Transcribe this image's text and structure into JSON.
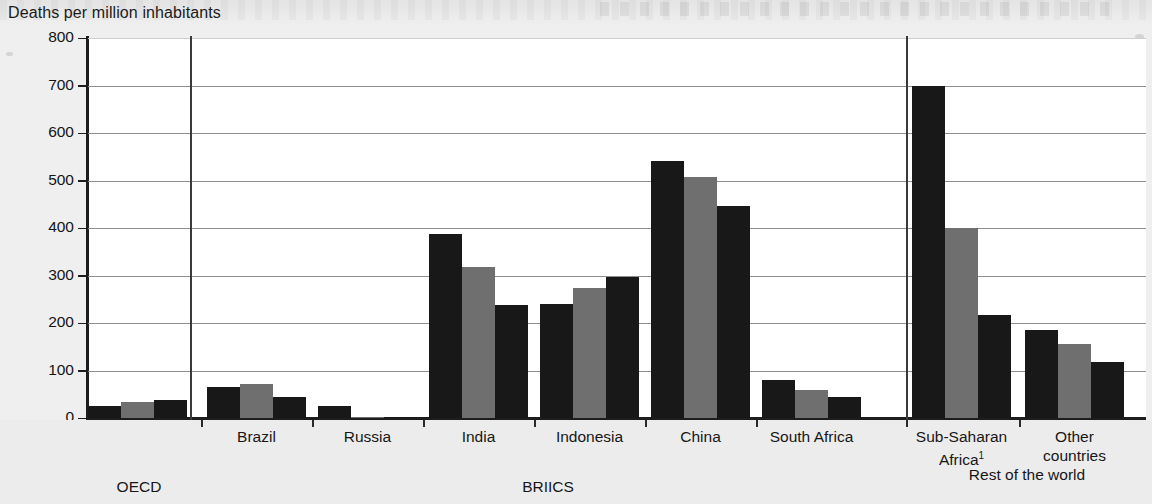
{
  "axis_title": "Deaths per million inhabitants",
  "colors": {
    "series_dark": "#181818",
    "series_gray": "#6f6f6f",
    "background": "#ececec",
    "plot_background": "#ffffff",
    "gridline": "#8e8e8e",
    "axis": "#1d1d1d"
  },
  "ytick_labels": [
    "800",
    "700",
    "600",
    "500",
    "400",
    "300",
    "200",
    "100",
    "0"
  ],
  "category_labels": [
    "OECD",
    "Brazil",
    "Russia",
    "India",
    "Indonesia",
    "China",
    "South Africa",
    "Sub-Saharan Africa",
    "Other countries"
  ],
  "supergroups": [
    {
      "label": "OECD"
    },
    {
      "label": "BRIICS"
    },
    {
      "label": "Rest of the world"
    }
  ],
  "footnote_marker": "1",
  "chart_data": {
    "type": "bar",
    "title": "Deaths per million inhabitants",
    "xlabel": "",
    "ylabel": "Deaths per million inhabitants",
    "ylim": [
      0,
      800
    ],
    "ytick_step": 100,
    "grid": true,
    "legend": "none",
    "categories": [
      "OECD",
      "Brazil",
      "Russia",
      "India",
      "Indonesia",
      "China",
      "South Africa",
      "Sub-Saharan Africa¹",
      "Other countries"
    ],
    "series": [
      {
        "name": "series-1",
        "color": "#181818",
        "values": [
          25,
          66,
          26,
          388,
          240,
          542,
          79,
          700,
          186
        ]
      },
      {
        "name": "series-2",
        "color": "#6f6f6f",
        "values": [
          33,
          71,
          2,
          318,
          274,
          508,
          60,
          400,
          155
        ]
      },
      {
        "name": "series-3",
        "color": "#181818",
        "values": [
          37,
          45,
          2,
          238,
          297,
          446,
          44,
          217,
          118
        ]
      }
    ],
    "group_brackets": [
      {
        "label": "OECD",
        "categories": [
          "OECD"
        ]
      },
      {
        "label": "BRIICS",
        "categories": [
          "Brazil",
          "Russia",
          "India",
          "Indonesia",
          "China",
          "South Africa"
        ]
      },
      {
        "label": "Rest of the world",
        "categories": [
          "Sub-Saharan Africa¹",
          "Other countries"
        ]
      }
    ]
  }
}
